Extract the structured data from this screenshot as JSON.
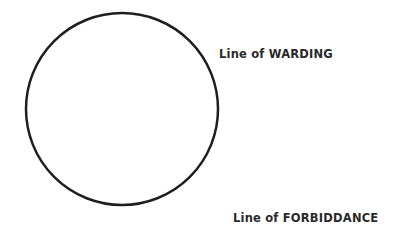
{
  "diagram": {
    "circle": {
      "cx": 122,
      "cy": 109,
      "r": 96,
      "stroke": "#1e1e1e",
      "stroke_width": 2.5
    },
    "labels": {
      "warding": "Line of WARDING",
      "forbiddance": "Line of FORBIDDANCE"
    }
  }
}
